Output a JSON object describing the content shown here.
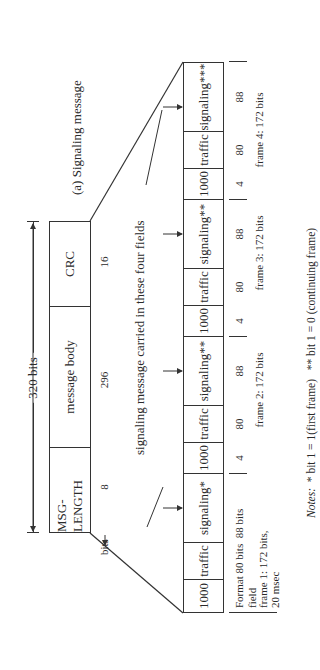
{
  "caption": "(a) Signaling message",
  "message": {
    "total_label": "320 bits",
    "fields": [
      {
        "name": "MSG-LENGTH",
        "bits": "8"
      },
      {
        "name": "message body",
        "bits": "296"
      },
      {
        "name": "CRC",
        "bits": "16"
      }
    ],
    "bits_label": "bits"
  },
  "carried_label": "signaling message carried in these four fields",
  "frames": [
    {
      "cells": [
        "1000",
        "traffic",
        "signaling*"
      ],
      "bits": [
        "Format 80 bits",
        "88 bits"
      ],
      "extra": [
        "field",
        "frame 1: 172 bits,",
        "20 msec"
      ]
    },
    {
      "cells": [
        "1000",
        "traffic",
        "signaling**"
      ],
      "bits": [
        "4",
        "80",
        "88"
      ],
      "label": "frame 2: 172 bits"
    },
    {
      "cells": [
        "1000",
        "traffic",
        "signaling**"
      ],
      "bits": [
        "4",
        "80",
        "88"
      ],
      "label": "frame 3: 172 bits"
    },
    {
      "cells": [
        "1000",
        "traffic",
        "signaling***"
      ],
      "bits": [
        "4",
        "80",
        "88"
      ],
      "label": "frame 4: 172 bits"
    }
  ],
  "notes": {
    "prefix": "Notes:",
    "note1": "* bit 1 = 1(first frame)",
    "note2": "** bit 1 = 0 (continuing frame)"
  }
}
